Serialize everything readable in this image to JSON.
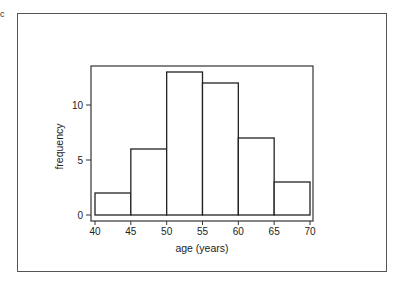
{
  "panel_label": "c",
  "chart_data": {
    "type": "bar",
    "subtype": "histogram",
    "title": "",
    "xlabel": "age (years)",
    "ylabel": "frequency",
    "bin_edges": [
      40,
      45,
      50,
      55,
      60,
      65,
      70
    ],
    "categories": [
      "40-45",
      "45-50",
      "50-55",
      "55-60",
      "60-65",
      "65-70"
    ],
    "values": [
      2,
      6,
      13,
      12,
      7,
      3
    ],
    "x_ticks": [
      "40",
      "45",
      "50",
      "55",
      "60",
      "65",
      "70"
    ],
    "y_ticks": [
      "0",
      "5",
      "10"
    ],
    "xlim": [
      40,
      70
    ],
    "ylim": [
      0,
      13.5
    ],
    "grid": false,
    "legend": null,
    "colors": {
      "bar_fill": "#ffffff",
      "bar_edge": "#222222",
      "frame": "#444444"
    }
  }
}
